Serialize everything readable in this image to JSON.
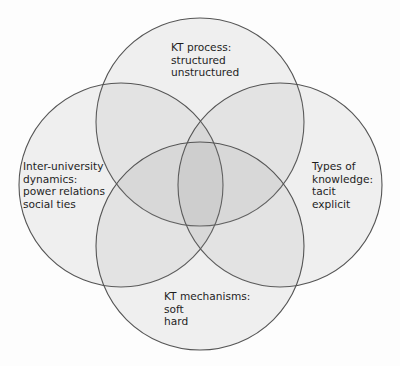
{
  "diagram": {
    "type": "venn",
    "background": "#ffffff",
    "circle_fill": "#8c8c8c",
    "circle_stroke": "#555555",
    "sets": [
      {
        "id": "kt-process",
        "position": "top",
        "title": "KT process:",
        "items": [
          "structured",
          "unstructured"
        ]
      },
      {
        "id": "inter-university-dynamics",
        "position": "left",
        "title_lines": [
          "Inter-university",
          "dynamics:"
        ],
        "items": [
          "power relations",
          "social ties"
        ]
      },
      {
        "id": "types-of-knowledge",
        "position": "right",
        "title_lines": [
          "Types of",
          "knowledge:"
        ],
        "items": [
          "tacit",
          "explicit"
        ]
      },
      {
        "id": "kt-mechanisms",
        "position": "bottom",
        "title": "KT mechanisms:",
        "items": [
          "soft",
          "hard"
        ]
      }
    ]
  }
}
